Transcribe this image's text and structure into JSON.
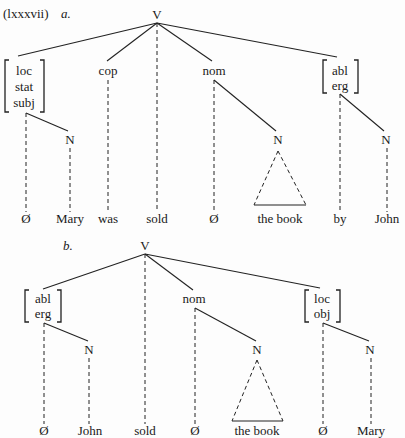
{
  "example_number": "(lxxxvii)",
  "trees": [
    {
      "label": "a.",
      "root": "V",
      "nodes": {
        "case1": [
          "loc",
          "stat",
          "subj"
        ],
        "cop": "cop",
        "nom": "nom",
        "case2": [
          "abl",
          "erg"
        ],
        "n1": "N",
        "n2": "N",
        "n3": "N"
      },
      "terminals": [
        "Ø",
        "Mary",
        "was",
        "sold",
        "Ø",
        "the book",
        "by",
        "John"
      ]
    },
    {
      "label": "b.",
      "root": "V",
      "nodes": {
        "case1": [
          "abl",
          "erg"
        ],
        "nom": "nom",
        "case2": [
          "loc",
          "obj"
        ],
        "n1": "N",
        "n2": "N",
        "n3": "N"
      },
      "terminals": [
        "Ø",
        "John",
        "sold",
        "Ø",
        "the book",
        "Ø",
        "Mary"
      ]
    }
  ]
}
